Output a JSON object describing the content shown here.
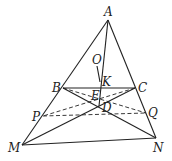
{
  "diagram": {
    "points": {
      "A": {
        "label": "A",
        "x": 108,
        "y": 20
      },
      "B": {
        "label": "B",
        "x": 63,
        "y": 88
      },
      "C": {
        "label": "C",
        "x": 135,
        "y": 88
      },
      "M": {
        "label": "M",
        "x": 22,
        "y": 145
      },
      "N": {
        "label": "N",
        "x": 156,
        "y": 138
      },
      "O": {
        "label": "O",
        "x": 97,
        "y": 65
      },
      "K": {
        "label": "K",
        "x": 100,
        "y": 88
      },
      "E": {
        "label": "E",
        "x": 97,
        "y": 98
      },
      "D": {
        "label": "D",
        "x": 99,
        "y": 106
      },
      "P": {
        "label": "P",
        "x": 43,
        "y": 116
      },
      "Q": {
        "label": "Q",
        "x": 146,
        "y": 113
      }
    },
    "solid_segments": [
      "AM",
      "AN",
      "MN",
      "BC",
      "AD",
      "OK",
      "BN",
      "CM"
    ],
    "dashed_segments": [
      "PQ",
      "BQ",
      "CP"
    ],
    "line_color": "#222222"
  }
}
